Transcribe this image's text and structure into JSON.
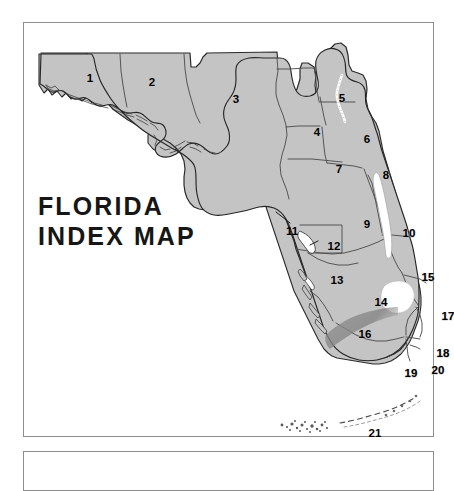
{
  "page": {
    "background_color": "#ffffff",
    "frame_color": "#8e8e8e"
  },
  "main_frame": {
    "name": "florida-index-map-panel"
  },
  "second_frame": {
    "name": "empty-panel-below"
  },
  "title": {
    "text": "FLORIDA\nINDEX MAP",
    "line1": "FLORIDA",
    "line2": "INDEX MAP",
    "color": "#161616"
  },
  "map": {
    "subject": "Florida",
    "land_fill": "#c4c4c4",
    "land_outline": "#2b2b2b",
    "region_boundary": "#4a4a4a",
    "water_fill": "#ffffff",
    "lake_name_visible": false,
    "features": {
      "lake_okeechobee": "white inland lake shape inside region 14",
      "indian_river_lagoon": "white coastal lagoon strip along region 10",
      "st_johns_river": "white river line between regions 5 and 6",
      "florida_keys": "dashed island chain arc at bottom labeled 21",
      "shark_river_slough": "dark shading across regions 16 and 19"
    },
    "regions": [
      {
        "id": "1",
        "label": "1",
        "x": 66,
        "y": 56,
        "outside": false
      },
      {
        "id": "2",
        "label": "2",
        "x": 128,
        "y": 60,
        "outside": false
      },
      {
        "id": "3",
        "label": "3",
        "x": 212,
        "y": 77,
        "outside": false
      },
      {
        "id": "4",
        "label": "4",
        "x": 293,
        "y": 110,
        "outside": false
      },
      {
        "id": "5",
        "label": "5",
        "x": 318,
        "y": 76,
        "outside": false
      },
      {
        "id": "6",
        "label": "6",
        "x": 343,
        "y": 117,
        "outside": false
      },
      {
        "id": "7",
        "label": "7",
        "x": 315,
        "y": 147,
        "outside": false
      },
      {
        "id": "8",
        "label": "8",
        "x": 362,
        "y": 153,
        "outside": false
      },
      {
        "id": "9",
        "label": "9",
        "x": 343,
        "y": 202,
        "outside": false
      },
      {
        "id": "10",
        "label": "10",
        "x": 385,
        "y": 211,
        "outside": false
      },
      {
        "id": "11",
        "label": "11",
        "x": 268,
        "y": 209,
        "outside": true
      },
      {
        "id": "12",
        "label": "12",
        "x": 310,
        "y": 224,
        "outside": false
      },
      {
        "id": "13",
        "label": "13",
        "x": 313,
        "y": 258,
        "outside": false
      },
      {
        "id": "14",
        "label": "14",
        "x": 357,
        "y": 280,
        "outside": false
      },
      {
        "id": "15",
        "label": "15",
        "x": 404,
        "y": 255,
        "outside": false
      },
      {
        "id": "16",
        "label": "16",
        "x": 341,
        "y": 312,
        "outside": false
      },
      {
        "id": "17",
        "label": "17",
        "x": 424,
        "y": 294,
        "outside": false
      },
      {
        "id": "18",
        "label": "18",
        "x": 419,
        "y": 331,
        "outside": false
      },
      {
        "id": "19",
        "label": "19",
        "x": 387,
        "y": 351,
        "outside": false
      },
      {
        "id": "20",
        "label": "20",
        "x": 414,
        "y": 348,
        "outside": false
      },
      {
        "id": "21",
        "label": "21",
        "x": 351,
        "y": 411,
        "outside": true
      }
    ]
  }
}
